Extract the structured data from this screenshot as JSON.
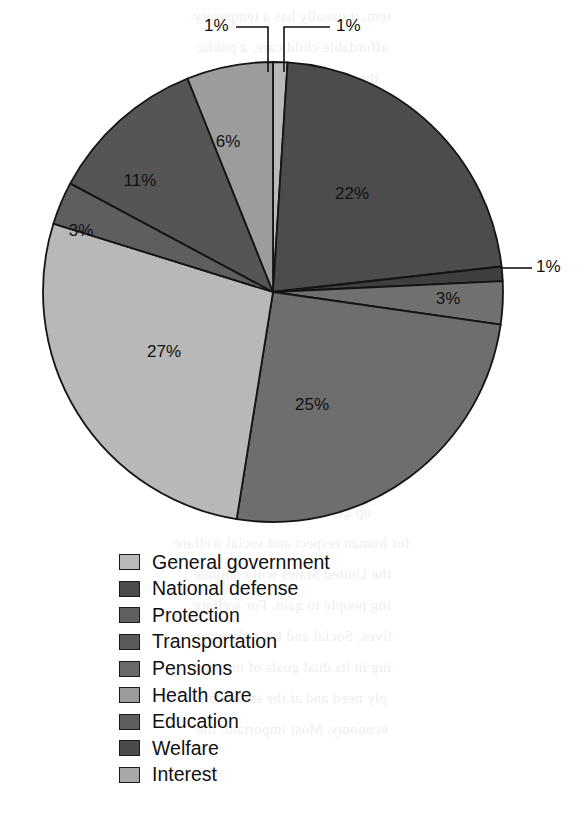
{
  "chart_data": {
    "type": "pie",
    "title": "",
    "xlabel": "",
    "ylabel": "",
    "legend_position": "bottom-left",
    "start_angle_deg": -90,
    "direction": "clockwise",
    "units": "percent",
    "categories": [
      "General government",
      "National defense",
      "Protection",
      "Transportation",
      "Pensions",
      "Health care",
      "Education",
      "Welfare",
      "Interest"
    ],
    "values": [
      1,
      22,
      1,
      3,
      25,
      27,
      3,
      11,
      6
    ],
    "labels": [
      "1%",
      "22%",
      "1%",
      "3%",
      "25%",
      "27%",
      "3%",
      "11%",
      "6%"
    ],
    "colors": [
      "#b9b9b9",
      "#4c4c4c",
      "#3f3f3f",
      "#707070",
      "#6e6e6e",
      "#b8b8b8",
      "#5e5e5e",
      "#555555",
      "#9c9c9c"
    ],
    "slices": [
      {
        "name": "General government",
        "value": 1,
        "label": "1%",
        "color": "#b9b9b9",
        "label_placement": "callout-top-right"
      },
      {
        "name": "National defense",
        "value": 22,
        "label": "22%",
        "color": "#4c4c4c",
        "label_placement": "inside"
      },
      {
        "name": "Protection",
        "value": 1,
        "label": "1%",
        "color": "#3f3f3f",
        "label_placement": "callout-right"
      },
      {
        "name": "Transportation",
        "value": 3,
        "label": "3%",
        "color": "#707070",
        "label_placement": "inside"
      },
      {
        "name": "Pensions",
        "value": 25,
        "label": "25%",
        "color": "#6e6e6e",
        "label_placement": "inside"
      },
      {
        "name": "Health care",
        "value": 27,
        "label": "27%",
        "color": "#b8b8b8",
        "label_placement": "inside"
      },
      {
        "name": "Education",
        "value": 3,
        "label": "3%",
        "color": "#5e5e5e",
        "label_placement": "inside"
      },
      {
        "name": "Welfare",
        "value": 11,
        "label": "11%",
        "color": "#555555",
        "label_placement": "inside"
      },
      {
        "name": "Interest",
        "value": 6,
        "label": "6%",
        "color": "#9c9c9c",
        "label_placement": "callout-top-left"
      }
    ]
  },
  "pie": {
    "inside_labels": [
      {
        "text": "22%",
        "x": 352,
        "y": 195
      },
      {
        "text": "25%",
        "x": 312,
        "y": 406
      },
      {
        "text": "27%",
        "x": 164,
        "y": 353
      },
      {
        "text": "11%",
        "x": 140,
        "y": 182
      },
      {
        "text": "6%",
        "x": 228,
        "y": 143
      },
      {
        "text": "3%",
        "x": 448,
        "y": 300
      },
      {
        "text": "3%",
        "x": 81,
        "y": 232
      }
    ],
    "callouts": [
      {
        "text": "1%",
        "text_x": 204,
        "text_y": 27,
        "leader": "M 236 27 L 268 27 L 268 72"
      },
      {
        "text": "1%",
        "text_x": 336,
        "text_y": 27,
        "leader": "M 330 27 L 284 27 L 284 72"
      },
      {
        "text": "1%",
        "text_x": 536,
        "text_y": 268,
        "leader": "M 532 268 L 500 268"
      }
    ]
  },
  "legend": {
    "items": [
      {
        "label": "General government",
        "color": "#b9b9b9"
      },
      {
        "label": "National defense",
        "color": "#4c4c4c"
      },
      {
        "label": "Protection",
        "color": "#606060"
      },
      {
        "label": "Transportation",
        "color": "#5a5a5a"
      },
      {
        "label": "Pensions",
        "color": "#6a6a6a"
      },
      {
        "label": "Health care",
        "color": "#9c9c9c"
      },
      {
        "label": "Education",
        "color": "#5e5e5e"
      },
      {
        "label": "Welfare",
        "color": "#4a4a4a"
      },
      {
        "label": "Interest",
        "color": "#a8a8a8"
      }
    ]
  },
  "bleed_text": {
    "lines": [
      "tem, it usually has a temporary",
      "affordable child care, a public",
      "the continuing support that",
      "he would probably pay for",
      "encouraged",
      "UAL Comparing the relative",
      "taken a good look at how really",
      "security, income distribution,",
      "government in a market economy.",
      "our survey: one sound that the",
      "nes much more than the other",
      "nter of the relative importance",
      "by general revenues",
      "Summary",
      "all-economic policies of the",
      "the development of the market",
      "up get from a set of laws",
      "for human respect and social welfare",
      "the United States will continue",
      "ing people to gain. For welfare",
      "tives. Social and tax policy can",
      "ing in its dual goals of meeting",
      "ply need and at the same time",
      "economy. Most important, the"
    ],
    "top": 8,
    "line_height": 31
  }
}
